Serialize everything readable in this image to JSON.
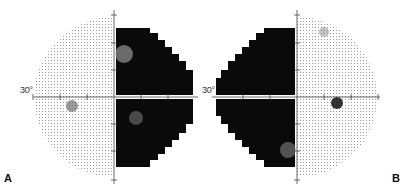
{
  "figure": {
    "panels": [
      {
        "id": "A",
        "label": "A",
        "eye": "left",
        "axis_label": "30°",
        "blind_side": "right",
        "blind_spot_side": "left"
      },
      {
        "id": "B",
        "label": "B",
        "eye": "right",
        "axis_label": "30°",
        "blind_side": "left",
        "blind_spot_side": "right"
      }
    ],
    "colors": {
      "defect": "#0a0a0a",
      "normal_dots": "#9a9a9a",
      "axis": "#444444",
      "background": "#ffffff"
    }
  }
}
